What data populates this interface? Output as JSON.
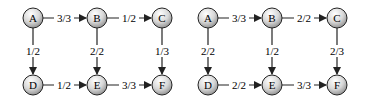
{
  "graphs": [
    {
      "nodes": {
        "A": "A",
        "B": "B",
        "C": "C",
        "D": "D",
        "E": "E",
        "F": "F"
      },
      "edges": {
        "AB": "3/3",
        "BC": "1/2",
        "AD": "1/2",
        "BE": "2/2",
        "CF": "1/3",
        "DE": "1/2",
        "EF": "3/3"
      }
    },
    {
      "nodes": {
        "A": "A",
        "B": "B",
        "C": "C",
        "D": "D",
        "E": "E",
        "F": "F"
      },
      "edges": {
        "AB": "3/3",
        "BC": "2/2",
        "AD": "2/2",
        "BE": "1/2",
        "CF": "2/3",
        "DE": "2/2",
        "EF": "3/3"
      }
    }
  ],
  "colors": {
    "node_fill_light": "#f4f4f4",
    "node_fill_dark": "#8c8c8c",
    "stroke": "#222222"
  }
}
